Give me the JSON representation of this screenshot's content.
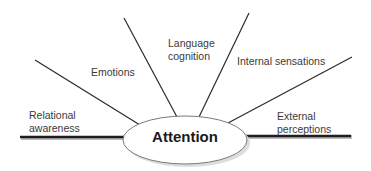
{
  "diagram": {
    "center": {
      "label": "Attention"
    },
    "branches": [
      {
        "id": "relational-awareness",
        "line1": "Relational",
        "line2": "awareness"
      },
      {
        "id": "emotions",
        "line1": "Emotions"
      },
      {
        "id": "language-cognition",
        "line1": "Language",
        "line2": "cognition"
      },
      {
        "id": "internal-sensations",
        "line1": "Internal sensations"
      },
      {
        "id": "external-perceptions",
        "line1": "External",
        "line2": "perceptions"
      }
    ],
    "colors": {
      "line": "#222222",
      "ellipse_fill": "#ffffff",
      "ellipse_stroke": "#777777",
      "text": "#3a3a3a"
    }
  }
}
